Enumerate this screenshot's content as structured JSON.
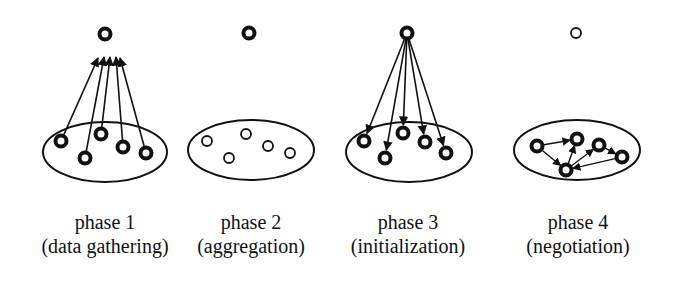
{
  "diagram": {
    "colors": {
      "stroke": "#111111",
      "background": "#ffffff"
    },
    "phases": [
      {
        "title": "phase 1",
        "subtitle": "(data gathering)",
        "label_x": 105,
        "top_node": {
          "x": 105,
          "y": 34,
          "style": "filled"
        },
        "group": {
          "cx": 105,
          "cy": 152,
          "rx": 62,
          "ry": 30
        },
        "nodes": [
          {
            "x": 61,
            "y": 141,
            "style": "filled"
          },
          {
            "x": 85,
            "y": 158,
            "style": "filled"
          },
          {
            "x": 101,
            "y": 134,
            "style": "filled"
          },
          {
            "x": 123,
            "y": 147,
            "style": "filled"
          },
          {
            "x": 146,
            "y": 153,
            "style": "filled"
          }
        ],
        "edges_direction": "nodes-to-top",
        "arrow_targets": [
          {
            "x": 98,
            "y": 58
          },
          {
            "x": 104,
            "y": 57
          },
          {
            "x": 110,
            "y": 57
          },
          {
            "x": 116,
            "y": 57
          },
          {
            "x": 120,
            "y": 58
          }
        ]
      },
      {
        "title": "phase 2",
        "subtitle": "(aggregation)",
        "label_x": 251,
        "top_node": {
          "x": 249,
          "y": 33,
          "style": "filled"
        },
        "group": {
          "cx": 251,
          "cy": 150,
          "rx": 63,
          "ry": 30
        },
        "nodes": [
          {
            "x": 207,
            "y": 141,
            "style": "hollow"
          },
          {
            "x": 229,
            "y": 158,
            "style": "hollow"
          },
          {
            "x": 246,
            "y": 134,
            "style": "hollow"
          },
          {
            "x": 268,
            "y": 146,
            "style": "hollow"
          },
          {
            "x": 290,
            "y": 153,
            "style": "hollow"
          }
        ],
        "edges_direction": "none"
      },
      {
        "title": "phase 3",
        "subtitle": "(initialization)",
        "label_x": 408,
        "top_node": {
          "x": 407,
          "y": 33,
          "style": "filled"
        },
        "group": {
          "cx": 409,
          "cy": 152,
          "rx": 63,
          "ry": 30
        },
        "nodes": [
          {
            "x": 364,
            "y": 141,
            "style": "filled"
          },
          {
            "x": 385,
            "y": 158,
            "style": "filled"
          },
          {
            "x": 403,
            "y": 133,
            "style": "filled"
          },
          {
            "x": 425,
            "y": 142,
            "style": "filled"
          },
          {
            "x": 446,
            "y": 153,
            "style": "filled"
          }
        ],
        "edges_direction": "top-to-nodes"
      },
      {
        "title": "phase 4",
        "subtitle": "(negotiation)",
        "label_x": 578,
        "top_node": {
          "x": 576,
          "y": 33,
          "style": "hollow"
        },
        "group": {
          "cx": 577,
          "cy": 150,
          "rx": 63,
          "ry": 30
        },
        "nodes": [
          {
            "x": 537,
            "y": 146,
            "style": "filled"
          },
          {
            "x": 577,
            "y": 139,
            "style": "filled"
          },
          {
            "x": 566,
            "y": 170,
            "style": "filled"
          },
          {
            "x": 599,
            "y": 145,
            "style": "filled"
          },
          {
            "x": 622,
            "y": 157,
            "style": "filled"
          }
        ],
        "edges_direction": "peer-to-peer",
        "edges": [
          {
            "from": 0,
            "to": 1
          },
          {
            "from": 0,
            "to": 2
          },
          {
            "from": 2,
            "to": 1
          },
          {
            "from": 2,
            "to": 3
          },
          {
            "from": 4,
            "to": 2
          },
          {
            "from": 3,
            "to": 4
          }
        ]
      }
    ]
  }
}
